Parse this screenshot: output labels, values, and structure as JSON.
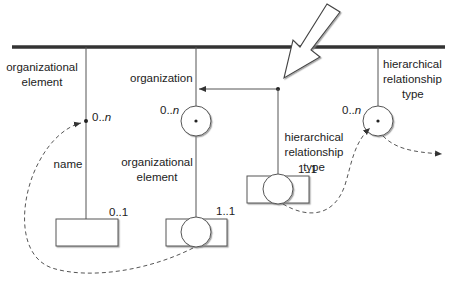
{
  "diagram": {
    "colors": {
      "line": "#555555",
      "text": "#222222",
      "bar": "#333333"
    },
    "columns": [
      {
        "id": "organizational-element",
        "label_line1": "organizational",
        "label_line2": "element",
        "multiplicity_prefix": "0..",
        "multiplicity_suffix": "n"
      },
      {
        "id": "organization",
        "label": "organization",
        "multiplicity_prefix": "0..",
        "multiplicity_suffix": "n"
      },
      {
        "id": "hierarchical-relationship-type-top",
        "label_line1": "hierarchical",
        "label_line2": "relationship",
        "label_line3": "type",
        "multiplicity_prefix": "0..",
        "multiplicity_suffix": "n"
      }
    ],
    "attributes": [
      {
        "id": "name",
        "label": "name",
        "multiplicity": "0..1"
      },
      {
        "id": "organizational-element-attr",
        "label_line1": "organizational",
        "label_line2": "element",
        "multiplicity": "1..1"
      },
      {
        "id": "hierarchical-relationship-type-attr",
        "label_line1": "hierarchical",
        "label_line2": "relationship",
        "label_line3": "type",
        "multiplicity": "1..1"
      }
    ]
  }
}
